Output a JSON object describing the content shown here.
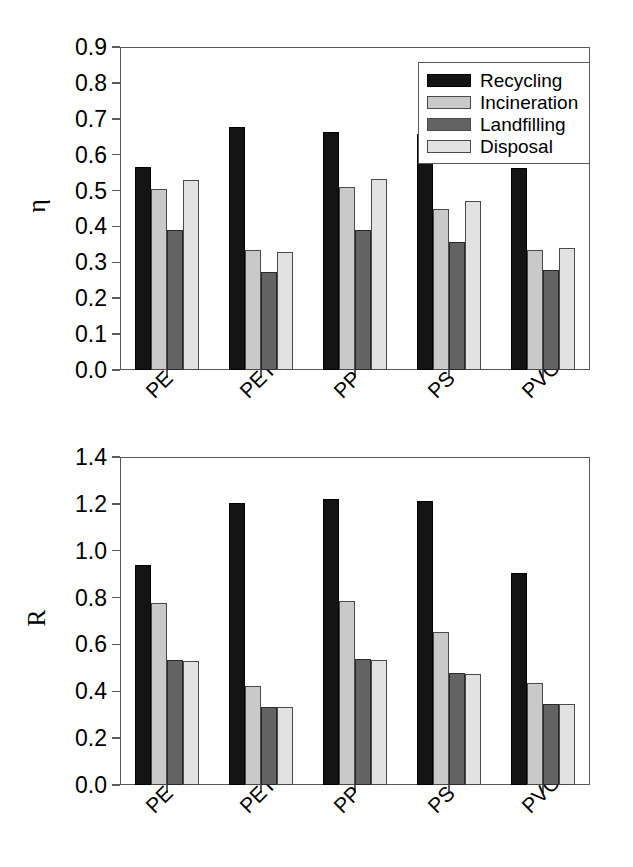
{
  "figure": {
    "title": "",
    "panels": [
      "eta-panel",
      "r-panel"
    ]
  },
  "legend": {
    "position": "top-right",
    "entries": [
      {
        "label": "Recycling",
        "color": "#141414"
      },
      {
        "label": "Incineration",
        "color": "#c9c9c9"
      },
      {
        "label": "Landfilling",
        "color": "#636363"
      },
      {
        "label": "Disposal",
        "color": "#e2e2e2"
      }
    ]
  },
  "chart_data": [
    {
      "type": "bar",
      "id": "eta",
      "title": "",
      "xlabel": "",
      "ylabel": "η",
      "ylim": [
        0.0,
        0.9
      ],
      "ytick_labels": [
        "0.0",
        "0.1",
        "0.2",
        "0.3",
        "0.4",
        "0.5",
        "0.6",
        "0.7",
        "0.8",
        "0.9"
      ],
      "ytick_values": [
        0.0,
        0.1,
        0.2,
        0.3,
        0.4,
        0.5,
        0.6,
        0.7,
        0.8,
        0.9
      ],
      "grid": false,
      "legend": "top-right",
      "categories": [
        "PE",
        "PET",
        "PP",
        "PS",
        "PVC"
      ],
      "series": [
        {
          "name": "Recycling",
          "color": "#141414",
          "values": [
            0.567,
            0.678,
            0.663,
            0.657,
            0.562
          ]
        },
        {
          "name": "Incineration",
          "color": "#c9c9c9",
          "values": [
            0.504,
            0.333,
            0.509,
            0.449,
            0.334
          ]
        },
        {
          "name": "Landfilling",
          "color": "#636363",
          "values": [
            0.39,
            0.272,
            0.391,
            0.357,
            0.278
          ]
        },
        {
          "name": "Disposal",
          "color": "#e2e2e2",
          "values": [
            0.529,
            0.329,
            0.531,
            0.47,
            0.341
          ]
        }
      ]
    },
    {
      "type": "bar",
      "id": "r",
      "title": "",
      "xlabel": "",
      "ylabel": "R",
      "ylim": [
        0.0,
        1.4
      ],
      "ytick_labels": [
        "0.0",
        "0.2",
        "0.4",
        "0.6",
        "0.8",
        "1.0",
        "1.2",
        "1.4"
      ],
      "ytick_values": [
        0.0,
        0.2,
        0.4,
        0.6,
        0.8,
        1.0,
        1.2,
        1.4
      ],
      "grid": false,
      "legend": "none",
      "categories": [
        "PE",
        "PET",
        "PP",
        "PS",
        "PVC"
      ],
      "series": [
        {
          "name": "Recycling",
          "color": "#141414",
          "values": [
            0.938,
            1.203,
            1.222,
            1.212,
            0.906
          ]
        },
        {
          "name": "Incineration",
          "color": "#c9c9c9",
          "values": [
            0.775,
            0.423,
            0.787,
            0.652,
            0.434
          ]
        },
        {
          "name": "Landfilling",
          "color": "#636363",
          "values": [
            0.534,
            0.332,
            0.538,
            0.476,
            0.345
          ]
        },
        {
          "name": "Disposal",
          "color": "#e2e2e2",
          "values": [
            0.53,
            0.331,
            0.535,
            0.474,
            0.344
          ]
        }
      ]
    }
  ]
}
